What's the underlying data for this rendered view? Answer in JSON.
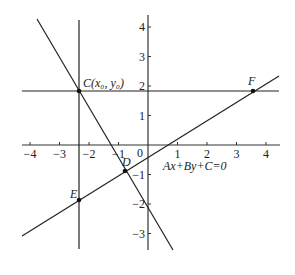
{
  "figure": {
    "origin_px": [
      148,
      145
    ],
    "unit_px": 29.5,
    "x_ticks": [
      "-4",
      "-3",
      "-2",
      "-1",
      "1",
      "2",
      "3",
      "4"
    ],
    "x_tick_values": [
      -4,
      -3,
      -2,
      -1,
      1,
      2,
      3,
      4
    ],
    "y_ticks": [
      "4",
      "3",
      "2",
      "1",
      "-1",
      "-2",
      "-3"
    ],
    "y_tick_values": [
      4,
      3,
      2,
      1,
      -1,
      -2,
      -3
    ],
    "origin_label": "0",
    "equation_label": "Ax+By+C=0",
    "points": {
      "C": {
        "label": "C(x₀, y₀)",
        "x": -2.34,
        "y": 1.83
      },
      "D": {
        "label": "D",
        "x": -0.78,
        "y": -0.88
      },
      "E": {
        "label": "E",
        "x": -2.34,
        "y": -1.86
      },
      "F": {
        "label": "F",
        "x": 3.56,
        "y": 1.83
      }
    },
    "lines": {
      "vertical_through_C": "x = x₀",
      "horizontal_through_C": "y = y₀",
      "steep_through_C_D": "line through C and D",
      "oblique_line": "Ax+By+C=0 through E, D, F"
    },
    "colors": {
      "line": "#222222",
      "axis": "#333333",
      "background": "#ffffff"
    }
  }
}
